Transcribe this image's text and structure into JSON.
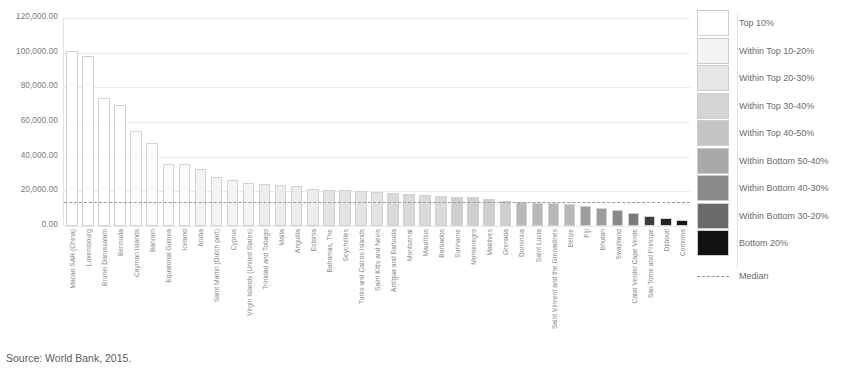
{
  "source_note": "Source: World Bank, 2015.",
  "axis": {
    "y_ticks": [
      "120,000.00",
      "100,000.00",
      "80,000.00",
      "60,000.00",
      "40,000.00",
      "20,000.00",
      "0.00"
    ]
  },
  "legend": {
    "items": [
      {
        "label": "Top 10%",
        "color": "#ffffff"
      },
      {
        "label": "Within Top 10-20%",
        "color": "#f4f4f4"
      },
      {
        "label": "Within Top 20-30%",
        "color": "#e6e6e6"
      },
      {
        "label": "Within Top 30-40%",
        "color": "#d5d5d5"
      },
      {
        "label": "Within Top 40-50%",
        "color": "#c4c4c4"
      },
      {
        "label": "Within Bottom 50-40%",
        "color": "#a9a9a9"
      },
      {
        "label": "Within Bottom 40-30%",
        "color": "#8a8a8a"
      },
      {
        "label": "Within Bottom 30-20%",
        "color": "#6a6a6a"
      },
      {
        "label": "Bottom 20%",
        "color": "#121212"
      }
    ],
    "median_label": "Median"
  },
  "chart_data": {
    "type": "bar",
    "title": "",
    "xlabel": "",
    "ylabel": "",
    "ylim": [
      0,
      120000
    ],
    "grid": true,
    "legend_position": "right",
    "median": 13800,
    "annotations": [
      "Source: World Bank, 2015."
    ],
    "categories": [
      "Macao SAR (China)",
      "Luxembourg",
      "Brunei Darussalam",
      "Bermuda",
      "Cayman Islands",
      "Bahrain",
      "Equatorial Guinea",
      "Iceland",
      "Aruba",
      "Saint Martin (Dutch part)",
      "Cyprus",
      "Virgin Islands (United States)",
      "Trinidad and Tobago",
      "Malta",
      "Anguilla",
      "Estonia",
      "Bahamas, The",
      "Seychelles",
      "Turks and Caicos Islands",
      "Saint Kitts and Nevis",
      "Antigua and Barbuda",
      "Montserrat",
      "Mauritius",
      "Barbados",
      "Suriname",
      "Montenegro",
      "Maldives",
      "Grenada",
      "Dominica",
      "Saint Lucia",
      "Saint Vincent and the Grenadines",
      "Belize",
      "Fiji",
      "Bhutan",
      "Swaziland",
      "Cabo Verde/ Cape Verde",
      "Sao Tome and Principe",
      "Djibouti",
      "Comoros"
    ],
    "values": [
      101000,
      98000,
      74000,
      70000,
      55000,
      48000,
      36000,
      36000,
      33000,
      28000,
      26500,
      25000,
      24000,
      23500,
      23000,
      21500,
      21000,
      20500,
      20000,
      19500,
      19000,
      18500,
      18000,
      17500,
      17000,
      16500,
      15500,
      14500,
      14000,
      13500,
      13000,
      12500,
      11500,
      10500,
      9500,
      7500,
      6000,
      4500,
      3500
    ],
    "bar_shades": [
      "#ffffff",
      "#ffffff",
      "#ffffff",
      "#ffffff",
      "#fbfbfb",
      "#fbfbfb",
      "#fbfbfb",
      "#fbfbfb",
      "#f4f4f4",
      "#f4f4f4",
      "#f4f4f4",
      "#f4f4f4",
      "#ededed",
      "#ededed",
      "#ededed",
      "#ededed",
      "#e4e4e4",
      "#e4e4e4",
      "#e4e4e4",
      "#e4e4e4",
      "#dadada",
      "#dadada",
      "#dadada",
      "#dadada",
      "#cfcfcf",
      "#cfcfcf",
      "#cfcfcf",
      "#cfcfcf",
      "#b8b8b8",
      "#b8b8b8",
      "#b8b8b8",
      "#b8b8b8",
      "#9c9c9c",
      "#9c9c9c",
      "#8a8a8a",
      "#7a7a7a",
      "#3c3c3c",
      "#222222",
      "#161616"
    ]
  }
}
